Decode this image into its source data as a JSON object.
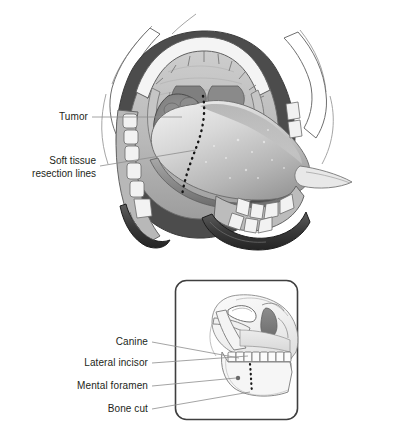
{
  "figure": {
    "panels": [
      {
        "id": "panel-top",
        "name": "intraoral-view",
        "description": "Open mouth intraoral view showing tongue, palate, teeth, tumor and dotted soft tissue resection line",
        "labels": [
          {
            "id": "tumor",
            "text": "Tumor",
            "lines": [
              "Tumor"
            ],
            "x": 88,
            "y": 112,
            "leader": {
              "x1": 92,
              "y1": 117,
              "x2": 182,
              "y2": 117
            }
          },
          {
            "id": "soft-tissue-resection-lines",
            "text": "Soft tissue resection lines",
            "lines": [
              "Soft tissue",
              "resection lines"
            ],
            "x": 96,
            "y": 155,
            "leader": {
              "x1": 100,
              "y1": 166,
              "x2": 196,
              "y2": 150
            }
          }
        ]
      },
      {
        "id": "panel-bottom",
        "name": "skull-profile-inset",
        "description": "Boxed lateral skull inset showing mandible, dentition and dotted bone cut",
        "box": {
          "x": 175,
          "y": 280,
          "width": 123,
          "height": 140,
          "radius": 11
        },
        "labels": [
          {
            "id": "canine",
            "text": "Canine",
            "lines": [
              "Canine"
            ],
            "x": 148,
            "y": 336,
            "leader": {
              "x1": 152,
              "y1": 342,
              "x2": 239,
              "y2": 358
            }
          },
          {
            "id": "lateral-incisor",
            "text": "Lateral incisor",
            "lines": [
              "Lateral incisor"
            ],
            "x": 148,
            "y": 358,
            "leader": {
              "x1": 152,
              "y1": 363,
              "x2": 248,
              "y2": 356
            }
          },
          {
            "id": "mental-foramen",
            "text": "Mental foramen",
            "lines": [
              "Mental foramen"
            ],
            "x": 148,
            "y": 381,
            "leader": {
              "x1": 152,
              "y1": 386,
              "x2": 236,
              "y2": 378
            }
          },
          {
            "id": "bone-cut",
            "text": "Bone cut",
            "lines": [
              "Bone cut"
            ],
            "x": 148,
            "y": 405,
            "leader": {
              "x1": 152,
              "y1": 409,
              "x2": 250,
              "y2": 392
            }
          }
        ]
      }
    ],
    "colors": {
      "background": "#ffffff",
      "text": "#231f20",
      "leader_line": "#8a8a8a",
      "outline": "#4a4a4a",
      "box_border": "#3f3f3f",
      "mucosa_light": "#d5d5d5",
      "mucosa_mid": "#b4b4b4",
      "mucosa_dark": "#6e6e6e",
      "tumor": "#6b6b6b",
      "tooth": "#f2f2f2",
      "shadow_deep": "#2e2e2e",
      "bone": "#efefef",
      "dotted_cut": "#1a1a1a"
    }
  }
}
